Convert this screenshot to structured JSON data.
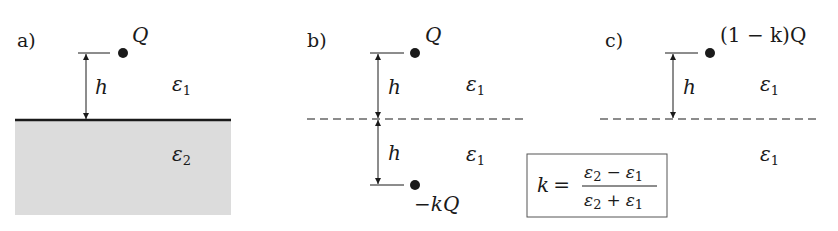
{
  "panels": {
    "a": {
      "label": "a)",
      "charge": "Q",
      "distance": "h",
      "upper_medium": "ε",
      "upper_medium_sub": "1",
      "lower_medium": "ε",
      "lower_medium_sub": "2",
      "boundary": "solid",
      "lower_fill": "#dcdcdc"
    },
    "b": {
      "label": "b)",
      "charge": "Q",
      "image_charge": "−kQ",
      "distance_upper": "h",
      "distance_lower": "h",
      "upper_medium": "ε",
      "upper_medium_sub": "1",
      "lower_medium": "ε",
      "lower_medium_sub": "1",
      "boundary": "dashed"
    },
    "c": {
      "label": "c)",
      "charge": "(1 − k)Q",
      "distance": "h",
      "upper_medium": "ε",
      "upper_medium_sub": "1",
      "lower_medium": "ε",
      "lower_medium_sub": "1",
      "boundary": "dashed"
    }
  },
  "formula": {
    "lhs": "k =",
    "numerator_a": "ε",
    "numerator_a_sub": "2",
    "numerator_op": "−",
    "numerator_b": "ε",
    "numerator_b_sub": "1",
    "denominator_a": "ε",
    "denominator_a_sub": "2",
    "denominator_op": "+",
    "denominator_b": "ε",
    "denominator_b_sub": "1"
  },
  "colors": {
    "ink": "#1a1a1a",
    "fill": "#dcdcdc",
    "box": "#555555"
  }
}
